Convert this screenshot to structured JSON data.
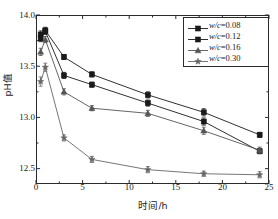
{
  "chart_data": {
    "type": "line",
    "title": "",
    "xlabel": "时间/h",
    "ylabel": "pH值",
    "xlim": [
      0,
      25
    ],
    "ylim": [
      12.35,
      14.0
    ],
    "xticks": [
      "0",
      "5",
      "10",
      "15",
      "20",
      "25"
    ],
    "xtick_values": [
      0,
      5,
      10,
      15,
      20,
      25
    ],
    "yticks": [
      "12.5",
      "13.0",
      "13.5",
      "14.0"
    ],
    "ytick_values": [
      12.5,
      13.0,
      13.5,
      14.0
    ],
    "grid": false,
    "legend_position": "top-right",
    "x": [
      0.5,
      1,
      3,
      6,
      12,
      18,
      24
    ],
    "series": [
      {
        "name": "w/c=0.08",
        "label_prefix": "w",
        "label_mid": "/c",
        "label_value": "=0.08",
        "marker": "square",
        "color": "#1a1a1a",
        "values": [
          13.81,
          13.85,
          13.59,
          13.42,
          13.22,
          13.05,
          12.83
        ],
        "errors": [
          0.035,
          0.03,
          0.025,
          0.025,
          0.03,
          0.035,
          0.025
        ]
      },
      {
        "name": "w/c=0.12",
        "label_prefix": "w",
        "label_mid": "/c",
        "label_value": "=0.12",
        "marker": "square",
        "color": "#1a1a1a",
        "values": [
          13.77,
          13.84,
          13.41,
          13.32,
          13.14,
          12.96,
          12.67
        ],
        "errors": [
          0.03,
          0.03,
          0.03,
          0.025,
          0.03,
          0.035,
          0.025
        ]
      },
      {
        "name": "w/c=0.16",
        "label_prefix": "w",
        "label_mid": "/c",
        "label_value": "=0.16",
        "marker": "triangle",
        "color": "#555555",
        "values": [
          13.64,
          13.76,
          13.25,
          13.09,
          13.04,
          12.87,
          12.68
        ],
        "errors": [
          0.035,
          0.03,
          0.03,
          0.025,
          0.03,
          0.035,
          0.03
        ]
      },
      {
        "name": "w/c=0.30",
        "label_prefix": "w",
        "label_mid": "/c",
        "label_value": "=0.30",
        "marker": "star",
        "color": "#666666",
        "values": [
          13.35,
          13.49,
          12.8,
          12.59,
          12.49,
          12.45,
          12.44
        ],
        "errors": [
          0.045,
          0.04,
          0.03,
          0.03,
          0.03,
          0.025,
          0.03
        ]
      }
    ]
  },
  "axes": {
    "xlabel": "时间/h",
    "ylabel": "pH值"
  },
  "legend": {
    "items": [
      {
        "text": "w/c=0.08",
        "marker": "square"
      },
      {
        "text": "w/c=0.12",
        "marker": "square"
      },
      {
        "text": "w/c=0.16",
        "marker": "triangle"
      },
      {
        "text": "w/c=0.30",
        "marker": "star"
      }
    ]
  }
}
